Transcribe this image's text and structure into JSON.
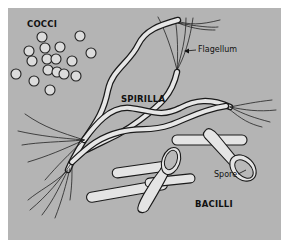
{
  "figure": {
    "labels": {
      "cocci": "COCCI",
      "spirilla": "SPIRILLA",
      "bacilli": "BACILLI",
      "flagellum": "Flagellum",
      "spore": "Spore"
    },
    "colors": {
      "background_panel": "#b4b4b4",
      "cell_fill": "#e2e2e2",
      "outline": "#1a1a1a",
      "page": "#ffffff"
    }
  }
}
